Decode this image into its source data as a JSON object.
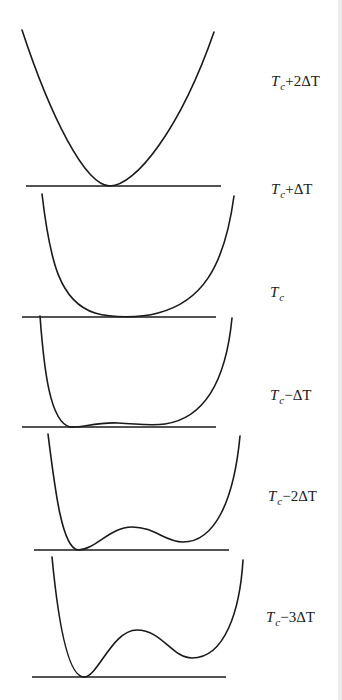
{
  "figure": {
    "stroke_color": "#1a1a1a",
    "stroke_width": 1.6,
    "panels": [
      {
        "label": {
          "T": "T",
          "sub": "c",
          "op": "+",
          "coef": "2",
          "delta": "ΔT",
          "x": 271,
          "y": 74
        },
        "baseline": {
          "x1": 26,
          "x2": 221,
          "y": 186
        },
        "curve": "M22,30 C50,115 85,186 110,186 C135,186 180,130 214,32"
      },
      {
        "label": {
          "T": "T",
          "sub": "c",
          "op": "+",
          "coef": "",
          "delta": "ΔT",
          "x": 271,
          "y": 182
        },
        "baseline": {
          "x1": 22,
          "x2": 216,
          "y": 317
        },
        "curve": "M42,194 C50,262 60,302 95,313 C112,318 140,318 158,313 C200,302 224,270 234,196"
      },
      {
        "label": {
          "T": "T",
          "sub": "c",
          "op": "",
          "coef": "",
          "delta": "",
          "x": 270,
          "y": 285
        },
        "baseline": {
          "x1": 22,
          "x2": 216,
          "y": 427
        },
        "curve": "M40,316 C44,370 50,422 70,427 C82,428 95,422 118,423 C140,424 150,426 165,424 C205,418 226,380 232,318"
      },
      {
        "label": {
          "T": "T",
          "sub": "c",
          "op": "−",
          "coef": "",
          "delta": "ΔT",
          "x": 270,
          "y": 388
        },
        "baseline": {
          "x1": 34,
          "x2": 229,
          "y": 550
        },
        "curve": "M48,434 C55,490 62,548 78,550 C95,550 110,527 132,527 C155,527 165,542 183,542 C215,542 234,500 240,436"
      },
      {
        "label": {
          "T": "T",
          "sub": "c",
          "op": "−",
          "coef": "2",
          "delta": "ΔT",
          "x": 268,
          "y": 489
        },
        "baseline": {
          "x1": 32,
          "x2": 226,
          "y": 677
        },
        "curve": "M52,557 C58,620 68,677 84,677 C98,677 112,630 137,630 C162,630 172,658 192,658 C225,658 240,610 243,560"
      },
      {
        "label": {
          "T": "T",
          "sub": "c",
          "op": "−",
          "coef": "3",
          "delta": "ΔT",
          "x": 266,
          "y": 610
        },
        "baseline": null,
        "curve": null
      }
    ]
  },
  "labels": [
    "Tc+2ΔT",
    "Tc+ΔT",
    "Tc",
    "Tc−ΔT",
    "Tc−2ΔT",
    "Tc−3ΔT"
  ]
}
